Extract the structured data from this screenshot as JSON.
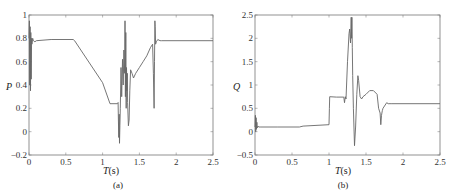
{
  "chart_data": [
    {
      "type": "line",
      "panel": "(a)",
      "title": "",
      "xlabel": "T(s)",
      "xlabel_italic": "T",
      "xlabel_unit": "(s)",
      "ylabel": "P",
      "xlim": [
        0,
        2.5
      ],
      "ylim": [
        -0.2,
        1
      ],
      "xticks": [
        "0",
        "0.5",
        "1",
        "1.5",
        "2",
        "2.5"
      ],
      "yticks": [
        "-0.2",
        "0",
        "0.2",
        "0.4",
        "0.6",
        "0.8",
        "1"
      ],
      "grid": false,
      "line_color": "#666666",
      "x": [
        0,
        0.005,
        0.01,
        0.015,
        0.02,
        0.025,
        0.03,
        0.035,
        0.04,
        0.05,
        0.06,
        0.08,
        0.1,
        0.3,
        0.6,
        0.62,
        1.0,
        1.1,
        1.2,
        1.21,
        1.215,
        1.22,
        1.225,
        1.23,
        1.235,
        1.24,
        1.25,
        1.26,
        1.27,
        1.28,
        1.29,
        1.3,
        1.305,
        1.31,
        1.315,
        1.32,
        1.325,
        1.33,
        1.335,
        1.34,
        1.35,
        1.36,
        1.37,
        1.38,
        1.4,
        1.42,
        1.45,
        1.5,
        1.55,
        1.6,
        1.65,
        1.68,
        1.69,
        1.7,
        1.705,
        1.71,
        1.715,
        1.72,
        1.73,
        1.75,
        1.78,
        1.8,
        2.5
      ],
      "y": [
        0.8,
        0.95,
        0.4,
        0.9,
        0.35,
        0.85,
        0.45,
        0.8,
        0.75,
        0.8,
        0.78,
        0.77,
        0.78,
        0.79,
        0.79,
        0.78,
        0.42,
        0.24,
        0.24,
        0.25,
        0.1,
        -0.05,
        0.15,
        -0.1,
        0.05,
        0.2,
        0.55,
        0.3,
        0.62,
        0.4,
        0.7,
        0.5,
        0.95,
        0.3,
        0.85,
        0.2,
        0.55,
        0.35,
        0.5,
        0.25,
        0.05,
        0.1,
        0.35,
        0.53,
        0.5,
        0.46,
        0.5,
        0.55,
        0.6,
        0.65,
        0.72,
        0.75,
        0.5,
        0.2,
        0.6,
        0.95,
        0.9,
        0.75,
        0.77,
        0.79,
        0.78,
        0.78,
        0.78
      ]
    },
    {
      "type": "line",
      "panel": "(b)",
      "title": "",
      "xlabel": "T(s)",
      "xlabel_italic": "T",
      "xlabel_unit": "(s)",
      "ylabel": "Q",
      "xlim": [
        0,
        2.5
      ],
      "ylim": [
        -0.5,
        2.5
      ],
      "xticks": [
        "0",
        "0.5",
        "1",
        "1.5",
        "2",
        "2.5"
      ],
      "yticks": [
        "-0.5",
        "0",
        "0.5",
        "1",
        "1.5",
        "2",
        "2.5"
      ],
      "grid": false,
      "line_color": "#666666",
      "x": [
        0,
        0.005,
        0.01,
        0.015,
        0.02,
        0.025,
        0.03,
        0.04,
        0.05,
        0.08,
        0.3,
        0.6,
        0.65,
        1.0,
        1.005,
        1.01,
        1.1,
        1.2,
        1.21,
        1.22,
        1.23,
        1.25,
        1.27,
        1.28,
        1.29,
        1.3,
        1.305,
        1.31,
        1.315,
        1.32,
        1.33,
        1.345,
        1.36,
        1.375,
        1.39,
        1.4,
        1.42,
        1.44,
        1.46,
        1.5,
        1.55,
        1.6,
        1.65,
        1.67,
        1.69,
        1.7,
        1.71,
        1.72,
        1.73,
        1.75,
        1.78,
        1.8,
        1.85,
        2.5
      ],
      "y": [
        0.1,
        0.35,
        0.0,
        0.3,
        0.05,
        0.2,
        0.08,
        0.12,
        0.1,
        0.1,
        0.1,
        0.1,
        0.12,
        0.15,
        0.5,
        0.75,
        0.74,
        0.74,
        0.62,
        0.75,
        0.7,
        1.5,
        2.1,
        2.2,
        1.9,
        2.45,
        2.0,
        2.45,
        1.8,
        1.2,
        0.5,
        -0.3,
        0.1,
        0.8,
        1.2,
        1.1,
        0.75,
        0.7,
        0.75,
        0.8,
        0.88,
        0.88,
        0.8,
        0.5,
        0.4,
        0.15,
        0.35,
        0.45,
        0.5,
        0.55,
        0.62,
        0.6,
        0.6,
        0.6
      ]
    }
  ],
  "panels": {
    "a": {
      "caption": "(a)",
      "ylabel": "P",
      "xlabel_italic": "T",
      "xlabel_unit": "(s)"
    },
    "b": {
      "caption": "(b)",
      "ylabel": "Q",
      "xlabel_italic": "T",
      "xlabel_unit": "(s)"
    }
  }
}
